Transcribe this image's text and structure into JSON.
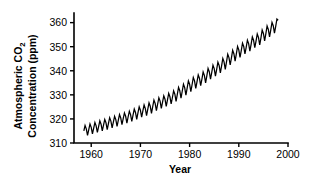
{
  "chart_data": {
    "type": "line",
    "title": "",
    "subtitle": "",
    "xlabel": "Year",
    "ylabel_line1": "Atmospheric CO",
    "ylabel_sub": "2",
    "ylabel_line2": "Concentration (ppm)",
    "ylabel_full": "Atmospheric CO2 Concentration (ppm)",
    "xlim": [
      1956.5,
      2000.0
    ],
    "ylim": [
      310,
      364
    ],
    "xticks": [
      1960,
      1970,
      1980,
      1990,
      2000
    ],
    "xtick_labels": [
      "1960",
      "1970",
      "1980",
      "1990",
      "2000"
    ],
    "yticks": [
      310,
      320,
      330,
      340,
      350,
      360
    ],
    "ytick_labels": [
      "310",
      "320",
      "330",
      "340",
      "350",
      "360"
    ],
    "grid": false,
    "legend": false,
    "legend_position": "none",
    "line_color": "#000000",
    "background_color": "#ffffff",
    "axis_color": "#000000",
    "series": [
      {
        "name": "Monthly mean atmospheric CO2 (Mauna Loa)",
        "description": "Keeling Curve: rising trend with annual seasonal sawtooth oscillation of roughly 6 ppm peak-to-peak",
        "x": [
          1958.5,
          1958.75,
          1959.0,
          1959.25,
          1959.5,
          1959.75,
          1960.0,
          1960.25,
          1960.5,
          1960.75,
          1961.0,
          1961.25,
          1961.5,
          1961.75,
          1962.0,
          1962.25,
          1962.5,
          1962.75,
          1963.0,
          1963.25,
          1963.5,
          1963.75,
          1964.0,
          1964.25,
          1964.5,
          1964.75,
          1965.0,
          1965.25,
          1965.5,
          1965.75,
          1966.0,
          1966.25,
          1966.5,
          1966.75,
          1967.0,
          1967.25,
          1967.5,
          1967.75,
          1968.0,
          1968.25,
          1968.5,
          1968.75,
          1969.0,
          1969.25,
          1969.5,
          1969.75,
          1970.0,
          1970.25,
          1970.5,
          1970.75,
          1971.0,
          1971.25,
          1971.5,
          1971.75,
          1972.0,
          1972.25,
          1972.5,
          1972.75,
          1973.0,
          1973.25,
          1973.5,
          1973.75,
          1974.0,
          1974.25,
          1974.5,
          1974.75,
          1975.0,
          1975.25,
          1975.5,
          1975.75,
          1976.0,
          1976.25,
          1976.5,
          1976.75,
          1977.0,
          1977.25,
          1977.5,
          1977.75,
          1978.0,
          1978.25,
          1978.5,
          1978.75,
          1979.0,
          1979.25,
          1979.5,
          1979.75,
          1980.0,
          1980.25,
          1980.5,
          1980.75,
          1981.0,
          1981.25,
          1981.5,
          1981.75,
          1982.0,
          1982.25,
          1982.5,
          1982.75,
          1983.0,
          1983.25,
          1983.5,
          1983.75,
          1984.0,
          1984.25,
          1984.5,
          1984.75,
          1985.0,
          1985.25,
          1985.5,
          1985.75,
          1986.0,
          1986.25,
          1986.5,
          1986.75,
          1987.0,
          1987.25,
          1987.5,
          1987.75,
          1988.0,
          1988.25,
          1988.5,
          1988.75,
          1989.0,
          1989.25,
          1989.5,
          1989.75,
          1990.0,
          1990.25,
          1990.5,
          1990.75,
          1991.0,
          1991.25,
          1991.5,
          1991.75,
          1992.0,
          1992.25,
          1992.5,
          1992.75,
          1993.0,
          1993.25,
          1993.5,
          1993.75,
          1994.0,
          1994.25,
          1994.5,
          1994.75,
          1995.0,
          1995.25,
          1995.5,
          1995.75,
          1996.0,
          1996.25,
          1996.5,
          1996.75,
          1997.0,
          1997.25,
          1997.5,
          1997.75,
          1998.0
        ],
        "values": [
          315.0,
          317.3,
          315.9,
          313.2,
          315.6,
          317.9,
          316.5,
          313.8,
          316.2,
          318.5,
          317.1,
          314.4,
          316.8,
          319.2,
          317.8,
          315.0,
          317.4,
          319.8,
          318.4,
          315.6,
          318.1,
          320.5,
          319.1,
          316.3,
          318.7,
          321.1,
          319.7,
          316.9,
          319.4,
          321.8,
          320.4,
          317.6,
          320.1,
          322.5,
          321.1,
          318.3,
          320.8,
          323.2,
          321.8,
          319.0,
          321.6,
          324.1,
          322.7,
          319.8,
          322.5,
          325.0,
          323.6,
          320.7,
          323.3,
          325.8,
          324.3,
          321.4,
          324.1,
          326.7,
          325.3,
          322.3,
          325.1,
          327.8,
          326.4,
          323.4,
          326.1,
          328.8,
          327.4,
          324.4,
          327.0,
          329.6,
          328.2,
          325.2,
          327.9,
          330.6,
          329.2,
          326.2,
          328.9,
          331.7,
          330.3,
          327.3,
          330.2,
          333.1,
          331.7,
          328.6,
          331.5,
          334.4,
          333.0,
          329.9,
          332.8,
          335.8,
          334.4,
          331.3,
          334.2,
          337.2,
          335.8,
          332.7,
          335.4,
          338.3,
          336.9,
          333.8,
          336.5,
          339.5,
          338.1,
          335.0,
          337.9,
          341.0,
          339.6,
          336.5,
          339.3,
          342.3,
          340.9,
          337.8,
          340.6,
          343.6,
          342.2,
          339.1,
          342.0,
          345.1,
          343.7,
          340.6,
          343.7,
          346.9,
          345.5,
          342.4,
          345.4,
          348.5,
          347.1,
          344.0,
          347.0,
          350.1,
          348.7,
          345.6,
          348.4,
          351.5,
          350.1,
          347.0,
          349.7,
          352.7,
          351.3,
          348.2,
          351.0,
          354.1,
          352.7,
          349.6,
          352.3,
          355.3,
          353.9,
          350.8,
          353.7,
          356.9,
          355.5,
          352.4,
          355.4,
          358.6,
          357.2,
          354.1,
          357.0,
          360.1,
          358.7,
          355.6,
          358.4,
          361.5,
          361.0
        ]
      }
    ],
    "annotations": []
  },
  "figure": {
    "background_color": "#ffffff",
    "width": 311,
    "height": 180
  }
}
